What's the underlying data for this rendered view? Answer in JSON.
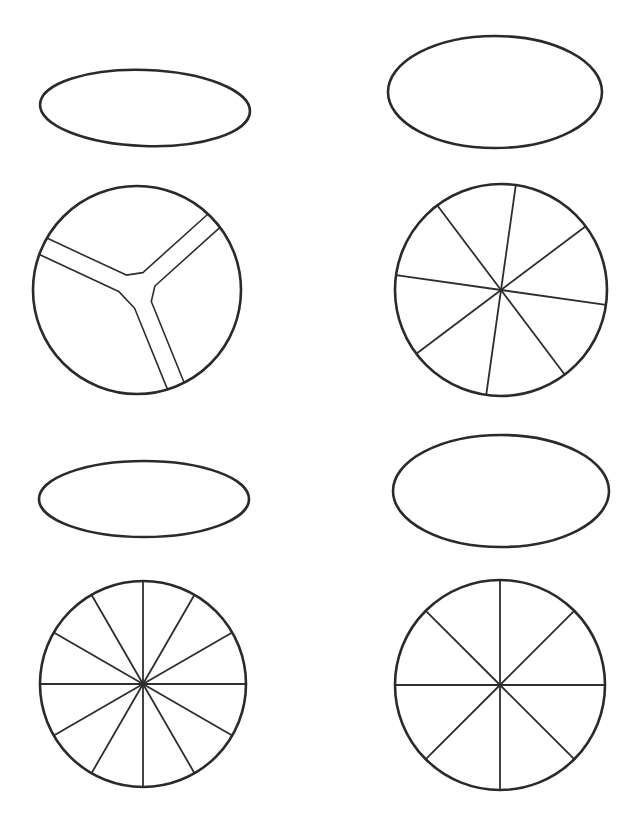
{
  "figure": {
    "width": 637,
    "height": 826,
    "stroke_color": "#2a2a2a",
    "background": "#ffffff"
  },
  "panels": [
    {
      "id": "top-left",
      "ellipse": {
        "cx": 145,
        "cy": 108,
        "rx": 105,
        "ry": 38,
        "rotate": 2
      },
      "circle": {
        "cx": 137,
        "cy": 290,
        "r": 104,
        "divisions": 3,
        "style": "double-line-y"
      }
    },
    {
      "id": "top-right",
      "ellipse": {
        "cx": 495,
        "cy": 92,
        "rx": 107,
        "ry": 56,
        "rotate": 0
      },
      "circle": {
        "cx": 501,
        "cy": 290,
        "r": 106,
        "divisions": 8,
        "style": "spokes",
        "offset_deg": 8
      }
    },
    {
      "id": "bottom-left",
      "ellipse": {
        "cx": 144,
        "cy": 499,
        "rx": 105,
        "ry": 38,
        "rotate": 0
      },
      "circle": {
        "cx": 143,
        "cy": 684,
        "r": 103,
        "divisions": 12,
        "style": "spokes",
        "offset_deg": 0
      }
    },
    {
      "id": "bottom-right",
      "ellipse": {
        "cx": 501,
        "cy": 491,
        "rx": 108,
        "ry": 56,
        "rotate": 0
      },
      "circle": {
        "cx": 500,
        "cy": 685,
        "r": 105,
        "divisions": 8,
        "style": "spokes",
        "offset_deg": 0
      }
    }
  ]
}
